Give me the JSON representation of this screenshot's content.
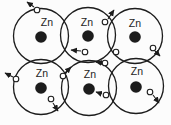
{
  "figure": {
    "element_symbol": "Zn",
    "colors": {
      "background": "#fcfcfc",
      "ink": "#1c1c1c",
      "electron_fill": "#ffffff"
    },
    "atom_radius": 27.5,
    "nucleus_radius": 5.8,
    "electron_radius": 2.8,
    "atoms": [
      {
        "cx": 41,
        "cy": 36,
        "label_x": 47,
        "label_y": 26
      },
      {
        "cx": 88,
        "cy": 35,
        "label_x": 87,
        "label_y": 26
      },
      {
        "cx": 135,
        "cy": 36,
        "label_x": 135,
        "label_y": 27
      },
      {
        "cx": 41,
        "cy": 87,
        "label_x": 42,
        "label_y": 77
      },
      {
        "cx": 89,
        "cy": 88,
        "label_x": 90,
        "label_y": 78
      },
      {
        "cx": 136,
        "cy": 86,
        "label_x": 137,
        "label_y": 75
      }
    ],
    "electrons": [
      {
        "cx": 37,
        "cy": 10,
        "arrow": {
          "x1": 34,
          "y1": 7,
          "x2": 27,
          "y2": 2
        }
      },
      {
        "cx": 105,
        "cy": 22,
        "arrow": {
          "x1": 108,
          "y1": 19,
          "x2": 114,
          "y2": 10
        }
      },
      {
        "cx": 153,
        "cy": 48,
        "arrow": {
          "x1": 155,
          "y1": 51,
          "x2": 160,
          "y2": 56
        }
      },
      {
        "cx": 85,
        "cy": 52,
        "arrow": {
          "x1": 81,
          "y1": 51,
          "x2": 71,
          "y2": 50
        }
      },
      {
        "cx": 116,
        "cy": 52,
        "arrow": null
      },
      {
        "cx": 105,
        "cy": 63,
        "arrow": {
          "x1": 102,
          "y1": 63,
          "x2": 96,
          "y2": 62
        }
      },
      {
        "cx": 63,
        "cy": 76,
        "arrow": {
          "x1": 65,
          "y1": 73,
          "x2": 71,
          "y2": 67
        }
      },
      {
        "cx": 16,
        "cy": 79,
        "arrow": {
          "x1": 13,
          "y1": 77,
          "x2": 5,
          "y2": 73
        }
      },
      {
        "cx": 51,
        "cy": 99,
        "arrow": {
          "x1": 53,
          "y1": 103,
          "x2": 58,
          "y2": 111
        }
      },
      {
        "cx": 106,
        "cy": 95,
        "arrow": {
          "x1": 102,
          "y1": 94,
          "x2": 96,
          "y2": 92
        }
      },
      {
        "cx": 150,
        "cy": 92,
        "arrow": {
          "x1": 153,
          "y1": 95,
          "x2": 159,
          "y2": 103
        }
      }
    ]
  }
}
